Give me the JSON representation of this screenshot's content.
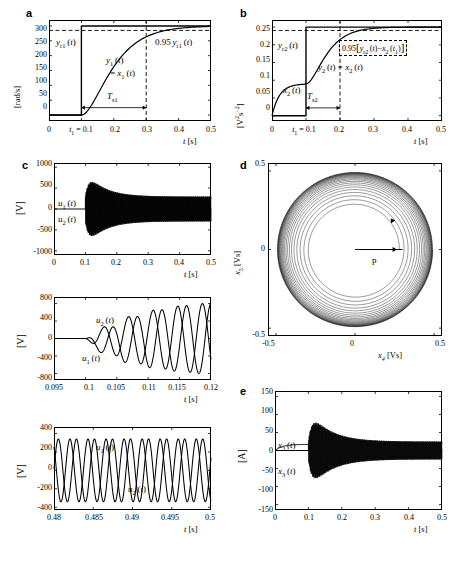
{
  "figure": {
    "panels": [
      {
        "letter": "a"
      },
      {
        "letter": "b"
      },
      {
        "letter": "c"
      },
      {
        "letter": "d"
      },
      {
        "letter": "e"
      }
    ]
  },
  "chart_data": [
    {
      "id": "a",
      "type": "line",
      "title": "",
      "xlabel": "t [s]",
      "ylabel": "[rad/s]",
      "xlim": [
        0,
        0.5
      ],
      "ylim": [
        -20,
        320
      ],
      "xticks": [
        "0",
        "t₁ = 0.1",
        "0.2",
        "0.3",
        "0.4",
        "0.5"
      ],
      "xtickvals": [
        0,
        0.1,
        0.2,
        0.3,
        0.4,
        0.5
      ],
      "yticks": [
        "0",
        "50",
        "100",
        "150",
        "200",
        "250",
        "300"
      ],
      "ytickvals": [
        0,
        50,
        100,
        150,
        200,
        250,
        300
      ],
      "grid": false,
      "series": [
        {
          "name": "y_r1(t)",
          "label": "yᵣ₁(t)",
          "style": "step",
          "desc": "reference step from 0 to 300 rad/s at t=0.1 s"
        },
        {
          "name": "y_1(t) = x_1(t)",
          "label": "y₁(t) = x₁(t)",
          "style": "solid",
          "desc": "first order smooth rise from 0 at t=0.1 to 300 by t~0.35"
        }
      ],
      "annotations": [
        {
          "text": "y",
          "sub": "r1",
          "suffix": "(t)",
          "name": "reference-label"
        },
        {
          "text": "y",
          "sub": "1",
          "suffix": "(t)",
          "name": "output-label"
        },
        {
          "text": "= x",
          "sub": "1",
          "suffix": "(t)",
          "name": "state-label"
        },
        {
          "text": "0.95 y",
          "sub": "r1",
          "suffix": "(t)",
          "name": "settling-level-label"
        },
        {
          "text": "T",
          "sub": "s1",
          "suffix": "",
          "name": "settling-time-label"
        }
      ],
      "markers": {
        "settling_level": 285,
        "settling_time_start": 0.1,
        "settling_time_end": 0.3,
        "step_time": 0.1,
        "final_value": 300
      }
    },
    {
      "id": "b",
      "type": "line",
      "title": "",
      "xlabel": "t [s]",
      "ylabel": "[V²s⁻²]",
      "xlim": [
        0,
        0.5
      ],
      "ylim": [
        -0.015,
        0.27
      ],
      "xticks": [
        "0",
        "t₁ = 0.1",
        "0.2",
        "0.3",
        "0.4",
        "0.5"
      ],
      "xtickvals": [
        0,
        0.1,
        0.2,
        0.3,
        0.4,
        0.5
      ],
      "yticks": [
        "0",
        "0.05",
        "0.1",
        "0.15",
        "0.2",
        "0.25"
      ],
      "ytickvals": [
        0,
        0.05,
        0.1,
        0.15,
        0.2,
        0.25
      ],
      "grid": false,
      "series": [
        {
          "name": "y_r2(t)",
          "label": "yᵣ₂(t)",
          "style": "step",
          "desc": "reference step from 0 to 0.25 at t=0.1 s"
        },
        {
          "name": "x_2(t)",
          "label": "x₂(t)",
          "style": "solid",
          "desc": "rises from 0 to ~0.09 before t=0.1"
        },
        {
          "name": "y_2(t) = x_2(t)",
          "label": "y₂(t) = x₂(t)",
          "style": "solid",
          "desc": "rises from 0.09 at t=0.1 to 0.25 by t~0.25"
        }
      ],
      "annotations": [
        {
          "text": "y",
          "sub": "r2",
          "suffix": "(t)",
          "name": "reference-label"
        },
        {
          "text": "x",
          "sub": "2",
          "suffix": "(t)",
          "name": "state-label"
        },
        {
          "text": "y",
          "sub": "2",
          "suffix": "(t) = x",
          "sub2": "2",
          "suffix2": "(t)",
          "name": "output-label"
        },
        {
          "text": "0.95[ y",
          "sub": "r2",
          "suffix": "(t) − x",
          "sub2": "2",
          "suffix2": "(t₁) ]",
          "name": "settling-level-label"
        },
        {
          "text": "T",
          "sub": "s2",
          "suffix": "",
          "name": "settling-time-label"
        }
      ],
      "markers": {
        "settling_level": 0.2405,
        "settling_time_start": 0.1,
        "settling_time_end": 0.2,
        "step_time": 0.1,
        "pre_step_value": 0.09,
        "final_value": 0.25
      }
    },
    {
      "id": "c1",
      "type": "line",
      "title": "",
      "xlabel": "t [s]",
      "ylabel": "[V]",
      "xlim": [
        0,
        0.5
      ],
      "ylim": [
        -1100,
        1100
      ],
      "xticks": [
        "0",
        "0.1",
        "0.2",
        "0.3",
        "0.4",
        "0.5"
      ],
      "xtickvals": [
        0,
        0.1,
        0.2,
        0.3,
        0.4,
        0.5
      ],
      "yticks": [
        "-1000",
        "-500",
        "0",
        "500",
        "1000"
      ],
      "ytickvals": [
        -1000,
        -500,
        0,
        500,
        1000
      ],
      "grid": false,
      "series": [
        {
          "name": "u_1(t)",
          "label": "u₁(t)",
          "style": "solid",
          "desc": "high frequency ~450 Hz burst starting t=0.1, peak ~900 V decaying to ~300 V"
        },
        {
          "name": "u_2(t)",
          "label": "u₂(t)",
          "style": "solid",
          "desc": "same envelope, phase shifted"
        }
      ],
      "annotations": [
        {
          "text": "u",
          "sub": "1",
          "suffix": "(t)",
          "name": "u1-label"
        },
        {
          "text": "u",
          "sub": "2",
          "suffix": "(t)",
          "name": "u2-label"
        }
      ],
      "envelope": {
        "peak": 900,
        "final": 300,
        "start_time": 0.1
      }
    },
    {
      "id": "c2",
      "type": "line",
      "title": "",
      "xlabel": "t [s]",
      "ylabel": "[V]",
      "xlim": [
        0.095,
        0.12
      ],
      "ylim": [
        -950,
        950
      ],
      "xticks": [
        "0.095",
        "0.1",
        "0.105",
        "0.11",
        "0.115",
        "0.12"
      ],
      "xtickvals": [
        0.095,
        0.1,
        0.105,
        0.11,
        0.115,
        0.12
      ],
      "yticks": [
        "-800",
        "-400",
        "0",
        "400",
        "800"
      ],
      "ytickvals": [
        -800,
        -400,
        0,
        400,
        800
      ],
      "grid": false,
      "series": [
        {
          "name": "u_1(t)",
          "label": "u₁(t)",
          "style": "solid",
          "desc": "growing oscillation from 0 at t=0.1 reaching -800 near t=0.12"
        },
        {
          "name": "u_2(t)",
          "label": "u₂(t)",
          "style": "solid",
          "desc": "growing oscillation leading u1 in phase"
        }
      ],
      "annotations": [
        {
          "text": "u",
          "sub": "2",
          "suffix": "(t)",
          "name": "u2-label"
        },
        {
          "text": "u",
          "sub": "1",
          "suffix": "(t)",
          "name": "u1-label"
        }
      ]
    },
    {
      "id": "c3",
      "type": "line",
      "title": "",
      "xlabel": "t [s]",
      "ylabel": "[V]",
      "xlim": [
        0.48,
        0.5
      ],
      "ylim": [
        -430,
        470
      ],
      "xticks": [
        "0.48",
        "0.485",
        "0.49",
        "0.495",
        "0.5"
      ],
      "xtickvals": [
        0.48,
        0.485,
        0.49,
        0.495,
        0.5
      ],
      "yticks": [
        "-400",
        "-200",
        "0",
        "200",
        "400"
      ],
      "ytickvals": [
        -400,
        -200,
        0,
        200,
        400
      ],
      "grid": false,
      "series": [
        {
          "name": "u_1(t)",
          "label": "u₁(t)",
          "style": "solid",
          "desc": "steady sinusoid amplitude ~340 V"
        },
        {
          "name": "u_2(t)",
          "label": "u₂(t)",
          "style": "solid",
          "desc": "steady sinusoid amplitude ~340 V, phase shifted"
        }
      ],
      "annotations": [
        {
          "text": "u",
          "sub": "1",
          "suffix": "(t)",
          "name": "u1-label"
        },
        {
          "text": "u",
          "sub": "2",
          "suffix": "(t)",
          "name": "u2-label"
        }
      ]
    },
    {
      "id": "d",
      "type": "line",
      "title": "",
      "xlabel": "x₄ [Vs]",
      "ylabel": "x₅ [Vs]",
      "xlim": [
        -0.55,
        0.55
      ],
      "ylim": [
        -0.55,
        0.55
      ],
      "xticks": [
        "-0.5",
        "0",
        "0.5"
      ],
      "xtickvals": [
        -0.5,
        0,
        0.5
      ],
      "yticks": [
        "-0.5",
        "0",
        "0.5"
      ],
      "ytickvals": [
        -0.5,
        0,
        0.5
      ],
      "grid": false,
      "series": [
        {
          "name": "flux-trajectory",
          "label": "",
          "style": "spiral",
          "desc": "outward spiral in (x4,x5) plane from radius ~0.28 to ~0.5"
        }
      ],
      "annotations": [
        {
          "text": "p",
          "sub": "",
          "suffix": "",
          "name": "point-p-label"
        }
      ],
      "markers": {
        "inner_radius": 0.28,
        "outer_radius": 0.5,
        "turns": 22
      }
    },
    {
      "id": "e",
      "type": "line",
      "title": "",
      "xlabel": "t [s]",
      "ylabel": "[A]",
      "xlim": [
        0,
        0.5
      ],
      "ylim": [
        -165,
        165
      ],
      "xticks": [
        "0",
        "0.1",
        "0.2",
        "0.3",
        "0.4",
        "0.5"
      ],
      "xtickvals": [
        0,
        0.1,
        0.2,
        0.3,
        0.4,
        0.5
      ],
      "yticks": [
        "-150",
        "-100",
        "-50",
        "0",
        "50",
        "100",
        "150"
      ],
      "ytickvals": [
        -150,
        -100,
        -50,
        0,
        50,
        100,
        150
      ],
      "grid": false,
      "series": [
        {
          "name": "x_2(t)",
          "label": "x₂(t)",
          "style": "solid",
          "desc": "ramps to ~17 A before t=0.1 then oscillates"
        },
        {
          "name": "x_3(t)",
          "label": "x₃(t)",
          "style": "solid",
          "desc": "high frequency current burst, peak ~110 A at t~0.13 decaying to ~25 A"
        }
      ],
      "annotations": [
        {
          "text": "x",
          "sub": "2",
          "suffix": "(t)",
          "name": "x2-label"
        },
        {
          "text": "x",
          "sub": "3",
          "suffix": "(t)",
          "name": "x3-label"
        }
      ],
      "envelope": {
        "peak": 110,
        "final": 25,
        "start_time": 0.1
      }
    }
  ]
}
